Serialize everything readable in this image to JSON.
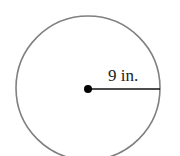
{
  "diagram": {
    "type": "circle",
    "radius_label": "9 in.",
    "radius_value": 9,
    "unit": "in.",
    "colors": {
      "circle_stroke": "#808080",
      "radius_line": "#111111",
      "center_dot": "#000000",
      "background": "#ffffff"
    }
  }
}
